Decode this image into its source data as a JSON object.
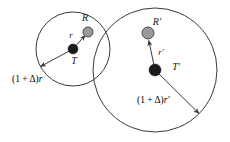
{
  "figure": {
    "background_color": "#ffffff",
    "line_color": "#3a3a3a",
    "sender_color": "#1a1a1a",
    "receiver_color": "#9a9a9a"
  },
  "left_group": {
    "name": "unprimed",
    "receiver_label": "R",
    "sender_label": "T",
    "radius_label": "r",
    "outer_radius_label_prefix": "(1 + Δ)",
    "outer_radius_label_symbol": "r",
    "outer_radius_label_full": "(1 + Δ)r",
    "circle": {
      "cx": 73,
      "cy": 49,
      "r": 37
    },
    "sender_node": {
      "cx": 73,
      "cy": 49,
      "r": 5
    },
    "receiver_node": {
      "cx": 88,
      "cy": 32,
      "r": 5
    }
  },
  "right_group": {
    "name": "primed",
    "receiver_label": "R′",
    "sender_label": "T′",
    "radius_label": "r′",
    "outer_radius_label_prefix": "(1 + Δ)",
    "outer_radius_label_symbol": "r′",
    "outer_radius_label_full": "(1 + Δ)r′",
    "circle": {
      "cx": 155,
      "cy": 70,
      "r": 62
    },
    "sender_node": {
      "cx": 155,
      "cy": 70,
      "r": 6
    },
    "receiver_node": {
      "cx": 148,
      "cy": 33,
      "r": 6
    }
  }
}
